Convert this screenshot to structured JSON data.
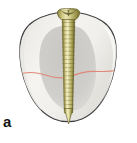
{
  "figure": {
    "panel_label": "a",
    "caption_text": "",
    "background_color": "#ffffff",
    "elements": {
      "tooth": {
        "name": "tooth-outline",
        "outline_color": "#3c3c3c",
        "fill_color": "#f2f1ee",
        "shading_color": "#e4e3df"
      },
      "pulp": {
        "name": "pulp-chamber-shadow",
        "fill_color": "#c9c8c6"
      },
      "fracture": {
        "name": "fracture-line",
        "stroke_color": "#e08878",
        "label": "fracture line"
      },
      "screw": {
        "name": "bone-screw",
        "body_color": "#c9c27a",
        "shadow_color": "#8e8743",
        "highlight_color": "#eee9b6",
        "outline_color": "#6e6930",
        "thread_count": 22,
        "head_type": "slotted-countersunk"
      }
    }
  }
}
